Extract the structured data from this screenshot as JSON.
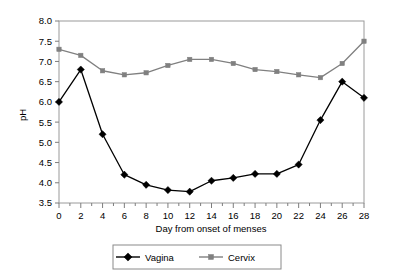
{
  "chart_data": {
    "type": "line",
    "title": "",
    "xlabel": "Day from onset of menses",
    "ylabel": "pH",
    "x": [
      0,
      2,
      4,
      6,
      8,
      10,
      12,
      14,
      16,
      18,
      20,
      22,
      24,
      26,
      28
    ],
    "categories": [
      "0",
      "2",
      "4",
      "6",
      "8",
      "10",
      "12",
      "14",
      "16",
      "18",
      "20",
      "22",
      "24",
      "26",
      "28"
    ],
    "xlim": [
      0,
      28
    ],
    "ylim": [
      3.5,
      8.0
    ],
    "ytick_labels": [
      "3.5",
      "4.0",
      "4.5",
      "5.0",
      "5.5",
      "6.0",
      "6.5",
      "7.0",
      "7.5",
      "8.0"
    ],
    "ytick_values": [
      3.5,
      4.0,
      4.5,
      5.0,
      5.5,
      6.0,
      6.5,
      7.0,
      7.5,
      8.0
    ],
    "xtick_labels": [
      "0",
      "2",
      "4",
      "6",
      "8",
      "10",
      "12",
      "14",
      "16",
      "18",
      "20",
      "22",
      "24",
      "26",
      "28"
    ],
    "grid": false,
    "legend_position": "bottom",
    "series": [
      {
        "name": "Vagina",
        "marker": "diamond",
        "color": "#000000",
        "values": [
          6.0,
          6.8,
          5.2,
          4.2,
          3.95,
          3.82,
          3.78,
          4.05,
          4.12,
          4.22,
          4.22,
          4.45,
          5.55,
          6.5,
          6.1
        ]
      },
      {
        "name": "Cervix",
        "marker": "square",
        "color": "#808080",
        "values": [
          7.3,
          7.15,
          6.77,
          6.67,
          6.72,
          6.9,
          7.05,
          7.05,
          6.95,
          6.8,
          6.75,
          6.67,
          6.6,
          6.95,
          7.5
        ]
      }
    ],
    "legend": [
      {
        "label": "Vagina",
        "marker": "diamond",
        "color": "#000000"
      },
      {
        "label": "Cervix",
        "marker": "square",
        "color": "#808080"
      }
    ]
  }
}
